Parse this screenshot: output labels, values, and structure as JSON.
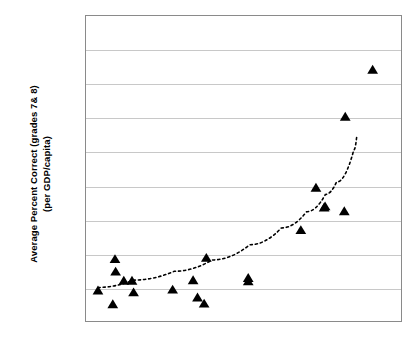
{
  "chart_data": {
    "type": "scatter",
    "title": "",
    "subtitle": "",
    "xlabel": "",
    "ylabel_line1": "Average Percent Correct (grades 7& 8)",
    "ylabel_line2": "(per GDP/capita)",
    "grid": true,
    "gridlines_y_count": 8,
    "legend": "none",
    "xtick_labels": [],
    "ytick_labels": [],
    "xlim": [
      0,
      100
    ],
    "ylim": [
      0,
      100
    ],
    "marker_shape": "triangle-up",
    "marker_color": "#000000",
    "series": [
      {
        "name": "Countries",
        "marker": "triangle-up",
        "points": [
          {
            "x": 3.8,
            "y": 9.8
          },
          {
            "x": 8.5,
            "y": 5.3
          },
          {
            "x": 9.2,
            "y": 20.1
          },
          {
            "x": 9.4,
            "y": 16.0
          },
          {
            "x": 12.0,
            "y": 13.0
          },
          {
            "x": 14.6,
            "y": 13.0
          },
          {
            "x": 15.1,
            "y": 9.2
          },
          {
            "x": 27.5,
            "y": 10.1
          },
          {
            "x": 34.0,
            "y": 13.2
          },
          {
            "x": 35.4,
            "y": 7.5
          },
          {
            "x": 37.5,
            "y": 5.5
          },
          {
            "x": 38.2,
            "y": 20.5
          },
          {
            "x": 51.5,
            "y": 12.8
          },
          {
            "x": 51.5,
            "y": 13.9
          },
          {
            "x": 68.2,
            "y": 29.6
          },
          {
            "x": 73.0,
            "y": 43.5
          },
          {
            "x": 75.6,
            "y": 37.0
          },
          {
            "x": 75.9,
            "y": 37.4
          },
          {
            "x": 82.0,
            "y": 35.8
          },
          {
            "x": 82.3,
            "y": 66.8
          },
          {
            "x": 91.0,
            "y": 82.2
          }
        ]
      }
    ],
    "trendline": {
      "style": "dotted",
      "color": "#000000",
      "description": "upward curving fitted trend",
      "path_points": [
        {
          "x": 3.8,
          "y": 11.0
        },
        {
          "x": 15.0,
          "y": 13.4
        },
        {
          "x": 28.0,
          "y": 16.3
        },
        {
          "x": 40.0,
          "y": 20.0
        },
        {
          "x": 52.0,
          "y": 25.0
        },
        {
          "x": 62.0,
          "y": 30.5
        },
        {
          "x": 70.0,
          "y": 35.8
        },
        {
          "x": 76.0,
          "y": 41.5
        },
        {
          "x": 79.5,
          "y": 45.5
        },
        {
          "x": 85.0,
          "y": 56.0
        },
        {
          "x": 86.0,
          "y": 61.0
        }
      ]
    }
  }
}
